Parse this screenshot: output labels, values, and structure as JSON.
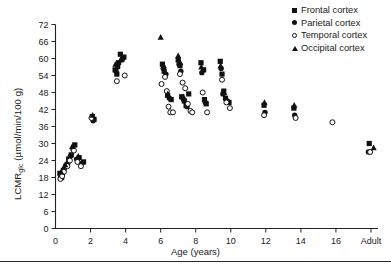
{
  "figure": {
    "xlabel": "Age (years)",
    "ylabel_main": "LCMR",
    "ylabel_sub": "glc",
    "ylabel_units": " (µmol/min/100 g)"
  },
  "legend": {
    "items": [
      {
        "label": "Frontal cortex",
        "marker": "filled-square-icon",
        "series": "frontal"
      },
      {
        "label": "Parietal cortex",
        "marker": "filled-circle-icon",
        "series": "parietal"
      },
      {
        "label": "Temporal cortex",
        "marker": "open-circle-icon",
        "series": "temporal"
      },
      {
        "label": "Occipital cortex",
        "marker": "filled-triangle-icon",
        "series": "occipital"
      }
    ]
  },
  "chart_data": {
    "type": "scatter",
    "title": "",
    "xlabel": "Age (years)",
    "ylabel": "LCMRglc (µmol/min/100 g)",
    "xlim": [
      0,
      18.4
    ],
    "ylim": [
      0,
      72
    ],
    "yticks": [
      0,
      6,
      12,
      18,
      24,
      30,
      36,
      42,
      48,
      54,
      60,
      66,
      72
    ],
    "xticks": [
      0,
      2,
      4,
      6,
      8,
      10,
      12,
      14,
      16,
      18
    ],
    "xticklabels": [
      "0",
      "2",
      "4",
      "6",
      "8",
      "10",
      "12",
      "14",
      "16",
      "Adult"
    ],
    "grid": false,
    "legend_position": "top-right",
    "series": [
      {
        "name": "Frontal cortex",
        "marker": "filled-square",
        "color": "#111111",
        "points": [
          [
            0.25,
            19.5
          ],
          [
            0.35,
            18.0
          ],
          [
            0.45,
            20.5
          ],
          [
            0.6,
            22.0
          ],
          [
            0.75,
            24.5
          ],
          [
            0.9,
            26.0
          ],
          [
            1.1,
            29.5
          ],
          [
            1.35,
            25.0
          ],
          [
            1.6,
            23.5
          ],
          [
            2.1,
            39.5
          ],
          [
            2.2,
            38.5
          ],
          [
            3.4,
            56.0
          ],
          [
            3.5,
            54.5
          ],
          [
            3.6,
            58.5
          ],
          [
            3.7,
            61.5
          ],
          [
            3.9,
            60.5
          ],
          [
            6.1,
            58.0
          ],
          [
            6.2,
            55.5
          ],
          [
            6.4,
            47.0
          ],
          [
            6.6,
            45.5
          ],
          [
            7.0,
            59.5
          ],
          [
            7.1,
            57.5
          ],
          [
            7.2,
            46.5
          ],
          [
            7.35,
            45.0
          ],
          [
            7.45,
            43.5
          ],
          [
            7.6,
            47.5
          ],
          [
            8.3,
            58.5
          ],
          [
            8.45,
            56.0
          ],
          [
            8.5,
            45.5
          ],
          [
            8.6,
            44.0
          ],
          [
            9.4,
            59.0
          ],
          [
            9.5,
            54.5
          ],
          [
            9.6,
            48.5
          ],
          [
            9.7,
            46.0
          ],
          [
            9.9,
            44.5
          ],
          [
            11.9,
            43.5
          ],
          [
            13.6,
            42.5
          ],
          [
            17.9,
            30.0
          ]
        ]
      },
      {
        "name": "Parietal cortex",
        "marker": "filled-circle",
        "color": "#111111",
        "points": [
          [
            0.3,
            18.5
          ],
          [
            0.4,
            19.5
          ],
          [
            0.5,
            21.0
          ],
          [
            0.7,
            23.0
          ],
          [
            0.85,
            25.5
          ],
          [
            1.0,
            28.0
          ],
          [
            1.2,
            24.5
          ],
          [
            1.5,
            23.0
          ],
          [
            2.15,
            38.0
          ],
          [
            3.45,
            55.5
          ],
          [
            3.55,
            57.0
          ],
          [
            3.8,
            59.5
          ],
          [
            6.15,
            56.5
          ],
          [
            6.3,
            54.5
          ],
          [
            6.5,
            46.0
          ],
          [
            7.05,
            58.0
          ],
          [
            7.15,
            55.5
          ],
          [
            7.3,
            45.5
          ],
          [
            7.5,
            43.0
          ],
          [
            8.35,
            55.0
          ],
          [
            8.55,
            44.5
          ],
          [
            9.45,
            56.5
          ],
          [
            9.55,
            47.5
          ],
          [
            9.8,
            45.0
          ],
          [
            11.95,
            41.0
          ],
          [
            13.65,
            40.0
          ],
          [
            17.85,
            27.0
          ]
        ]
      },
      {
        "name": "Temporal cortex",
        "marker": "open-circle",
        "color": "#111111",
        "points": [
          [
            0.28,
            17.5
          ],
          [
            0.38,
            18.5
          ],
          [
            0.48,
            20.0
          ],
          [
            0.68,
            22.0
          ],
          [
            0.82,
            24.0
          ],
          [
            1.05,
            27.5
          ],
          [
            1.25,
            23.5
          ],
          [
            1.45,
            22.0
          ],
          [
            2.05,
            39.0
          ],
          [
            3.5,
            52.0
          ],
          [
            3.95,
            54.0
          ],
          [
            6.05,
            51.0
          ],
          [
            6.25,
            53.5
          ],
          [
            6.35,
            48.5
          ],
          [
            6.45,
            43.0
          ],
          [
            6.55,
            41.0
          ],
          [
            6.7,
            41.0
          ],
          [
            7.1,
            54.5
          ],
          [
            7.25,
            51.5
          ],
          [
            7.4,
            49.5
          ],
          [
            7.55,
            44.0
          ],
          [
            7.7,
            41.5
          ],
          [
            7.8,
            41.0
          ],
          [
            8.4,
            48.0
          ],
          [
            8.65,
            41.0
          ],
          [
            9.5,
            52.5
          ],
          [
            9.75,
            44.5
          ],
          [
            9.95,
            42.5
          ],
          [
            11.9,
            40.0
          ],
          [
            13.7,
            39.0
          ],
          [
            15.8,
            37.5
          ],
          [
            17.95,
            27.0
          ]
        ]
      },
      {
        "name": "Occipital cortex",
        "marker": "filled-triangle",
        "color": "#111111",
        "points": [
          [
            0.32,
            20.0
          ],
          [
            0.55,
            22.5
          ],
          [
            0.95,
            29.0
          ],
          [
            1.3,
            25.5
          ],
          [
            2.12,
            40.0
          ],
          [
            3.42,
            58.0
          ],
          [
            3.75,
            60.0
          ],
          [
            6.0,
            67.5
          ],
          [
            6.18,
            57.5
          ],
          [
            6.4,
            47.5
          ],
          [
            7.0,
            61.0
          ],
          [
            7.12,
            58.5
          ],
          [
            7.3,
            46.5
          ],
          [
            8.32,
            57.0
          ],
          [
            9.42,
            57.5
          ],
          [
            9.62,
            48.0
          ],
          [
            11.92,
            44.5
          ],
          [
            13.62,
            43.5
          ],
          [
            18.15,
            28.5
          ]
        ]
      }
    ]
  }
}
